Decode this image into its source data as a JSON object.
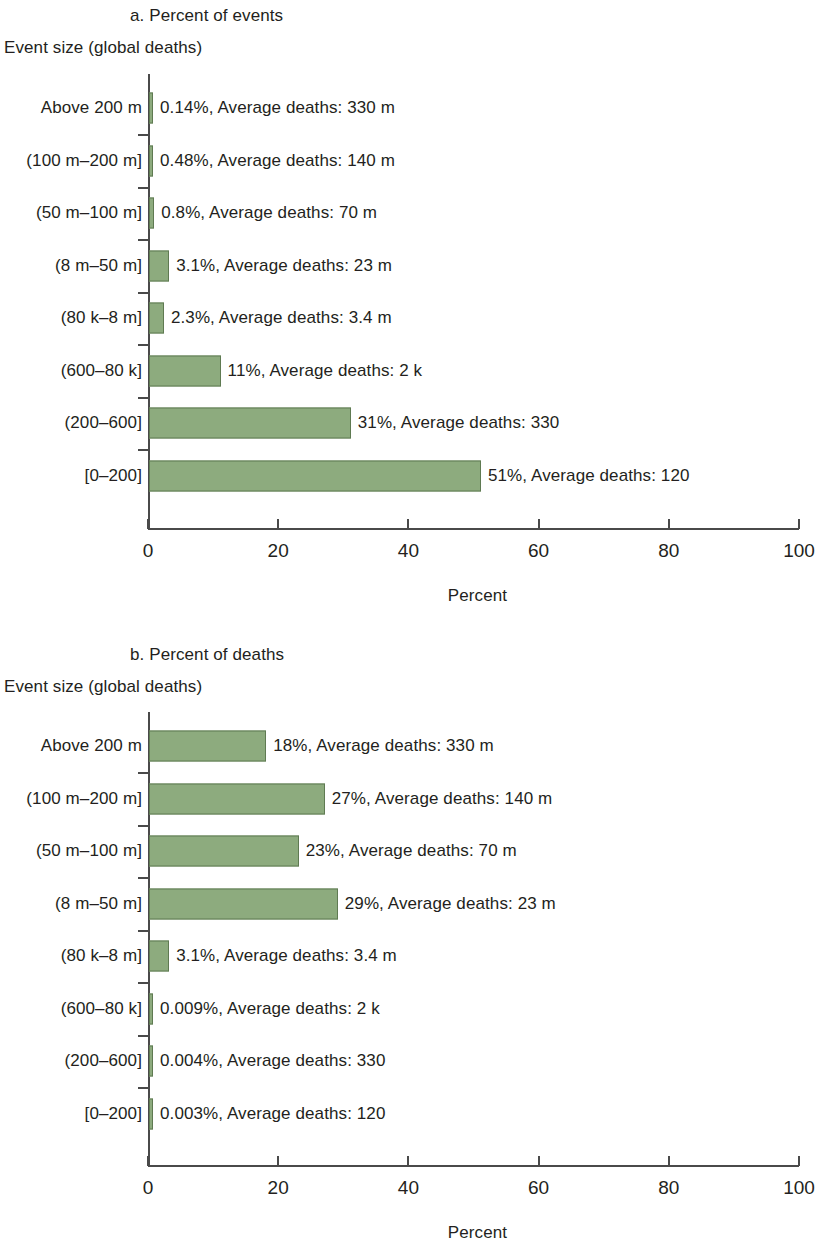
{
  "figure": {
    "y_axis_title": "Event size (global deaths)",
    "x_axis_title": "Percent",
    "bar_color": "#8dab7e",
    "bar_border_color": "#5f7a52",
    "axis_color": "#4a4a4a"
  },
  "panels": [
    {
      "id": "panel-a",
      "title": "a. Percent of events",
      "y_axis_title": "Event size (global deaths)",
      "x_axis_title": "Percent",
      "x_ticks": [
        "0",
        "20",
        "40",
        "60",
        "80",
        "100"
      ],
      "rows": [
        {
          "category": "Above 200 m",
          "percent": 0.14,
          "label": "0.14%, Average deaths: 330 m"
        },
        {
          "category": "(100 m–200 m]",
          "percent": 0.48,
          "label": "0.48%, Average deaths: 140 m"
        },
        {
          "category": "(50 m–100 m]",
          "percent": 0.8,
          "label": "0.8%, Average deaths: 70 m"
        },
        {
          "category": "(8 m–50 m]",
          "percent": 3.1,
          "label": "3.1%, Average deaths: 23 m"
        },
        {
          "category": "(80 k–8 m]",
          "percent": 2.3,
          "label": "2.3%, Average deaths: 3.4 m"
        },
        {
          "category": "(600–80 k]",
          "percent": 11,
          "label": "11%, Average deaths: 2 k"
        },
        {
          "category": "(200–600]",
          "percent": 31,
          "label": "31%, Average deaths: 330"
        },
        {
          "category": "[0–200]",
          "percent": 51,
          "label": "51%, Average deaths: 120"
        }
      ]
    },
    {
      "id": "panel-b",
      "title": "b. Percent of deaths",
      "y_axis_title": "Event size (global deaths)",
      "x_axis_title": "Percent",
      "x_ticks": [
        "0",
        "20",
        "40",
        "60",
        "80",
        "100"
      ],
      "rows": [
        {
          "category": "Above 200 m",
          "percent": 18,
          "label": "18%, Average deaths: 330 m"
        },
        {
          "category": "(100 m–200 m]",
          "percent": 27,
          "label": "27%, Average deaths: 140 m"
        },
        {
          "category": "(50 m–100 m]",
          "percent": 23,
          "label": "23%, Average deaths: 70 m"
        },
        {
          "category": "(8 m–50 m]",
          "percent": 29,
          "label": "29%, Average deaths: 23 m"
        },
        {
          "category": "(80 k–8 m]",
          "percent": 3.1,
          "label": "3.1%, Average deaths: 3.4 m"
        },
        {
          "category": "(600–80 k]",
          "percent": 0.009,
          "label": "0.009%, Average deaths: 2 k"
        },
        {
          "category": "(200–600]",
          "percent": 0.004,
          "label": "0.004%, Average deaths: 330"
        },
        {
          "category": "[0–200]",
          "percent": 0.003,
          "label": "0.003%, Average deaths: 120"
        }
      ]
    }
  ],
  "chart_data": [
    {
      "type": "bar",
      "orientation": "horizontal",
      "title": "a. Percent of events",
      "xlabel": "Percent",
      "ylabel": "Event size (global deaths)",
      "xlim": [
        0,
        100
      ],
      "xticks": [
        0,
        20,
        40,
        60,
        80,
        100
      ],
      "grid": false,
      "legend": null,
      "categories": [
        "Above 200 m",
        "(100 m–200 m]",
        "(50 m–100 m]",
        "(8 m–50 m]",
        "(80 k–8 m]",
        "(600–80 k]",
        "(200–600]",
        "[0–200]"
      ],
      "values": [
        0.14,
        0.48,
        0.8,
        3.1,
        2.3,
        11,
        31,
        51
      ],
      "annotations": [
        "0.14%, Average deaths: 330 m",
        "0.48%, Average deaths: 140 m",
        "0.8%, Average deaths: 70 m",
        "3.1%, Average deaths: 23 m",
        "2.3%, Average deaths: 3.4 m",
        "11%, Average deaths: 2 k",
        "31%, Average deaths: 330",
        "51%, Average deaths: 120"
      ],
      "average_deaths": [
        "330 m",
        "140 m",
        "70 m",
        "23 m",
        "3.4 m",
        "2 k",
        "330",
        "120"
      ]
    },
    {
      "type": "bar",
      "orientation": "horizontal",
      "title": "b. Percent of deaths",
      "xlabel": "Percent",
      "ylabel": "Event size (global deaths)",
      "xlim": [
        0,
        100
      ],
      "xticks": [
        0,
        20,
        40,
        60,
        80,
        100
      ],
      "grid": false,
      "legend": null,
      "categories": [
        "Above 200 m",
        "(100 m–200 m]",
        "(50 m–100 m]",
        "(8 m–50 m]",
        "(80 k–8 m]",
        "(600–80 k]",
        "(200–600]",
        "[0–200]"
      ],
      "values": [
        18,
        27,
        23,
        29,
        3.1,
        0.009,
        0.004,
        0.003
      ],
      "annotations": [
        "18%, Average deaths: 330 m",
        "27%, Average deaths: 140 m",
        "23%, Average deaths: 70 m",
        "29%, Average deaths: 23 m",
        "3.1%, Average deaths: 3.4 m",
        "0.009%, Average deaths: 2 k",
        "0.004%, Average deaths: 330",
        "0.003%, Average deaths: 120"
      ],
      "average_deaths": [
        "330 m",
        "140 m",
        "70 m",
        "23 m",
        "3.4 m",
        "2 k",
        "330",
        "120"
      ]
    }
  ]
}
